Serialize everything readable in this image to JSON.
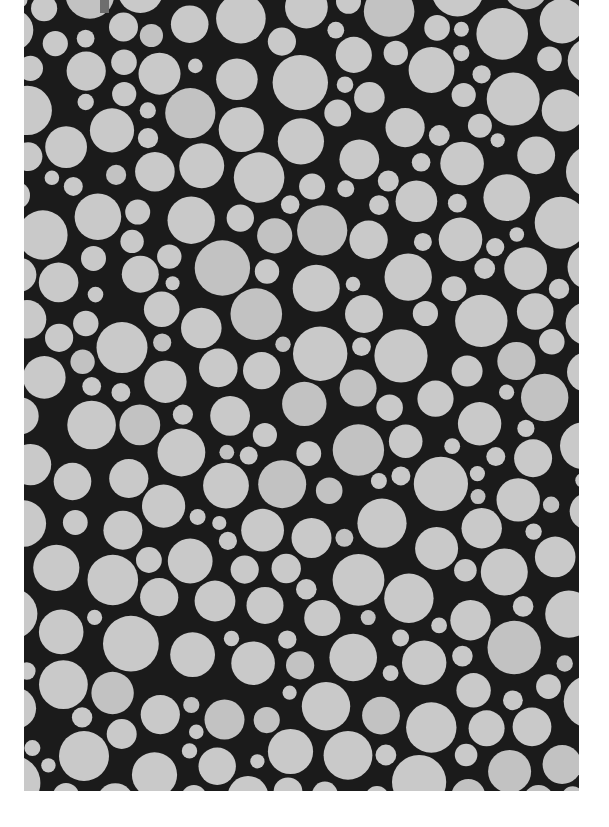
{
  "image": {
    "description": "Dense random packing of light gray circles on a black background (texture / micrograph-like pattern)",
    "frame": {
      "x": 24,
      "y": 0,
      "width": 555,
      "height": 791
    },
    "colors": {
      "page_background": "#ffffff",
      "texture_background": "#1b1b1b",
      "circle_fill": "#c9c9c9",
      "circle_fill_alt": "#c2c2c2",
      "top_artifact": "#6e6e6e"
    },
    "circles": {
      "min_radius": 7,
      "max_radius": 28,
      "gap": 3,
      "seed": 20240611,
      "attempts": 9000
    },
    "artifacts": [
      {
        "type": "dark-gray-notch",
        "x": 100,
        "y": 0,
        "width": 9,
        "height": 13
      }
    ]
  }
}
